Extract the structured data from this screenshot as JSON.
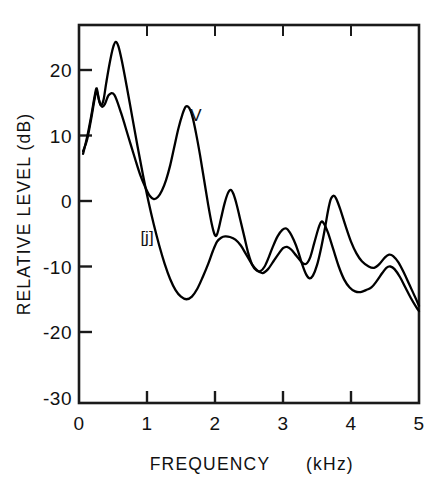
{
  "chart_data": {
    "type": "line",
    "title": "",
    "xlabel": "FREQUENCY   (kHz)",
    "ylabel": "RELATIVE LEVEL (dB)",
    "xlabel_main": "FREQUENCY",
    "xlabel_unit": "(kHz)",
    "xlim": [
      0,
      5
    ],
    "ylim": [
      -30,
      25
    ],
    "grid": false,
    "legend": "inline-annotations",
    "xticks": [
      0,
      1,
      2,
      3,
      4,
      5
    ],
    "xtick_labels": [
      "0",
      "1",
      "2",
      "3",
      "4",
      "5"
    ],
    "yticks": [
      20,
      10,
      0,
      -10,
      -20,
      -30
    ],
    "ytick_labels": [
      "20",
      "10",
      "0",
      "-10",
      "-20",
      "-30"
    ],
    "series": [
      {
        "name": "[j]",
        "label": "[j]",
        "annotation_x": 1.0,
        "annotation_y": -5.5,
        "color": "#000000",
        "points": [
          [
            0.06,
            7.2
          ],
          [
            0.12,
            9.8
          ],
          [
            0.18,
            13.0
          ],
          [
            0.23,
            16.0
          ],
          [
            0.26,
            17.2
          ],
          [
            0.29,
            15.6
          ],
          [
            0.32,
            14.6
          ],
          [
            0.36,
            15.4
          ],
          [
            0.4,
            18.0
          ],
          [
            0.45,
            21.0
          ],
          [
            0.5,
            23.4
          ],
          [
            0.54,
            24.3
          ],
          [
            0.58,
            23.6
          ],
          [
            0.63,
            21.4
          ],
          [
            0.7,
            17.6
          ],
          [
            0.78,
            13.0
          ],
          [
            0.86,
            8.4
          ],
          [
            0.94,
            4.0
          ],
          [
            1.02,
            0.0
          ],
          [
            1.1,
            -3.6
          ],
          [
            1.18,
            -6.8
          ],
          [
            1.26,
            -9.6
          ],
          [
            1.34,
            -11.9
          ],
          [
            1.42,
            -13.6
          ],
          [
            1.5,
            -14.6
          ],
          [
            1.58,
            -15.0
          ],
          [
            1.66,
            -14.6
          ],
          [
            1.74,
            -13.4
          ],
          [
            1.82,
            -11.6
          ],
          [
            1.9,
            -9.6
          ],
          [
            1.97,
            -7.6
          ],
          [
            2.03,
            -6.2
          ],
          [
            2.09,
            -5.6
          ],
          [
            2.15,
            -5.4
          ],
          [
            2.22,
            -5.5
          ],
          [
            2.3,
            -5.9
          ],
          [
            2.38,
            -6.8
          ],
          [
            2.46,
            -8.2
          ],
          [
            2.54,
            -9.6
          ],
          [
            2.62,
            -10.6
          ],
          [
            2.7,
            -11.0
          ],
          [
            2.78,
            -10.4
          ],
          [
            2.86,
            -9.2
          ],
          [
            2.94,
            -8.0
          ],
          [
            3.0,
            -7.2
          ],
          [
            3.06,
            -7.0
          ],
          [
            3.12,
            -7.4
          ],
          [
            3.2,
            -8.4
          ],
          [
            3.28,
            -9.4
          ],
          [
            3.34,
            -9.6
          ],
          [
            3.4,
            -8.6
          ],
          [
            3.46,
            -6.4
          ],
          [
            3.52,
            -4.2
          ],
          [
            3.56,
            -3.2
          ],
          [
            3.6,
            -3.4
          ],
          [
            3.66,
            -4.8
          ],
          [
            3.74,
            -7.4
          ],
          [
            3.82,
            -10.0
          ],
          [
            3.9,
            -12.0
          ],
          [
            3.98,
            -13.2
          ],
          [
            4.06,
            -13.8
          ],
          [
            4.14,
            -13.9
          ],
          [
            4.22,
            -13.6
          ],
          [
            4.3,
            -13.2
          ],
          [
            4.38,
            -12.2
          ],
          [
            4.46,
            -11.0
          ],
          [
            4.52,
            -10.2
          ],
          [
            4.58,
            -10.0
          ],
          [
            4.64,
            -10.4
          ],
          [
            4.72,
            -11.6
          ],
          [
            4.8,
            -13.2
          ],
          [
            4.88,
            -14.8
          ],
          [
            4.96,
            -16.2
          ],
          [
            5.0,
            -16.8
          ]
        ]
      },
      {
        "name": "V",
        "label": "V",
        "annotation_x": 1.72,
        "annotation_y": 13.2,
        "color": "#000000",
        "points": [
          [
            0.06,
            7.6
          ],
          [
            0.12,
            9.4
          ],
          [
            0.18,
            12.6
          ],
          [
            0.23,
            15.6
          ],
          [
            0.26,
            16.8
          ],
          [
            0.3,
            15.2
          ],
          [
            0.34,
            14.4
          ],
          [
            0.38,
            14.8
          ],
          [
            0.44,
            16.2
          ],
          [
            0.52,
            16.2
          ],
          [
            0.62,
            13.4
          ],
          [
            0.72,
            10.0
          ],
          [
            0.82,
            6.6
          ],
          [
            0.9,
            4.0
          ],
          [
            0.98,
            2.0
          ],
          [
            1.04,
            0.8
          ],
          [
            1.1,
            0.3
          ],
          [
            1.16,
            0.6
          ],
          [
            1.22,
            1.6
          ],
          [
            1.28,
            3.2
          ],
          [
            1.34,
            5.4
          ],
          [
            1.4,
            8.2
          ],
          [
            1.46,
            11.0
          ],
          [
            1.52,
            13.2
          ],
          [
            1.57,
            14.4
          ],
          [
            1.62,
            14.2
          ],
          [
            1.67,
            12.8
          ],
          [
            1.72,
            10.4
          ],
          [
            1.78,
            7.0
          ],
          [
            1.84,
            3.2
          ],
          [
            1.9,
            -0.6
          ],
          [
            1.95,
            -3.4
          ],
          [
            1.99,
            -5.0
          ],
          [
            2.02,
            -5.3
          ],
          [
            2.05,
            -4.4
          ],
          [
            2.09,
            -2.6
          ],
          [
            2.14,
            -0.4
          ],
          [
            2.19,
            1.2
          ],
          [
            2.23,
            1.7
          ],
          [
            2.27,
            1.1
          ],
          [
            2.32,
            -0.6
          ],
          [
            2.37,
            -2.8
          ],
          [
            2.43,
            -5.4
          ],
          [
            2.49,
            -8.0
          ],
          [
            2.55,
            -9.8
          ],
          [
            2.61,
            -10.6
          ],
          [
            2.67,
            -10.7
          ],
          [
            2.73,
            -10.0
          ],
          [
            2.79,
            -8.6
          ],
          [
            2.85,
            -7.0
          ],
          [
            2.92,
            -5.4
          ],
          [
            2.99,
            -4.4
          ],
          [
            3.05,
            -4.2
          ],
          [
            3.1,
            -4.8
          ],
          [
            3.16,
            -6.0
          ],
          [
            3.22,
            -7.6
          ],
          [
            3.28,
            -9.6
          ],
          [
            3.34,
            -11.2
          ],
          [
            3.39,
            -11.8
          ],
          [
            3.44,
            -11.4
          ],
          [
            3.5,
            -9.8
          ],
          [
            3.56,
            -7.2
          ],
          [
            3.62,
            -4.0
          ],
          [
            3.66,
            -1.6
          ],
          [
            3.7,
            0.2
          ],
          [
            3.74,
            0.8
          ],
          [
            3.78,
            0.4
          ],
          [
            3.84,
            -1.2
          ],
          [
            3.92,
            -3.8
          ],
          [
            4.0,
            -6.2
          ],
          [
            4.08,
            -8.0
          ],
          [
            4.16,
            -9.2
          ],
          [
            4.26,
            -10.0
          ],
          [
            4.34,
            -10.2
          ],
          [
            4.42,
            -9.6
          ],
          [
            4.5,
            -8.6
          ],
          [
            4.56,
            -8.2
          ],
          [
            4.62,
            -8.4
          ],
          [
            4.7,
            -9.4
          ],
          [
            4.78,
            -11.0
          ],
          [
            4.86,
            -12.8
          ],
          [
            4.94,
            -14.6
          ],
          [
            5.0,
            -16.0
          ]
        ]
      }
    ]
  },
  "axis": {
    "y_title": "RELATIVE LEVEL (dB)",
    "x_title_main": "FREQUENCY",
    "x_title_unit": "(kHz)"
  }
}
